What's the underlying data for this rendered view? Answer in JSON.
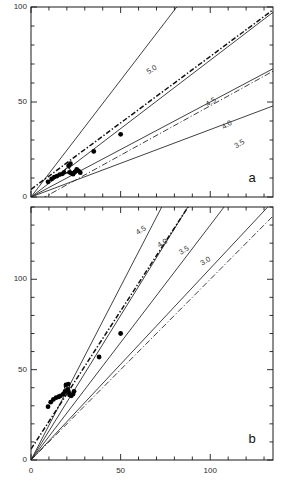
{
  "figure": {
    "panel_a_tag": "a",
    "panel_b_tag": "b"
  },
  "chart_data": [
    {
      "panel": "a",
      "type": "scatter",
      "title": "",
      "xlabel": "",
      "ylabel": "",
      "xlim": [
        0,
        135
      ],
      "ylim": [
        0,
        100
      ],
      "xticks_major": [
        0,
        50,
        100
      ],
      "xticks_minor_step": 10,
      "yticks_major": [
        0,
        50,
        100
      ],
      "yticks_minor_step": 10,
      "xticklabels": [
        "",
        "",
        ""
      ],
      "yticklabels": [
        "0",
        "50",
        "100"
      ],
      "grid": false,
      "legend": "none",
      "annotations": [
        {
          "text": "5.0",
          "x": 68,
          "y": 66
        },
        {
          "text": "4.5",
          "x": 101,
          "y": 49
        },
        {
          "text": "4.0",
          "x": 110,
          "y": 37
        },
        {
          "text": "3.5",
          "x": 117,
          "y": 27
        }
      ],
      "model_lines": [
        {
          "label": "5.0",
          "slope": 1.23,
          "intercept": 0.0
        },
        {
          "label": "4.5",
          "slope": 0.72,
          "intercept": 0.0
        },
        {
          "label": "4.0",
          "slope": 0.5,
          "intercept": 0.0
        },
        {
          "label": "3.5",
          "slope": 0.355,
          "intercept": 0.0
        }
      ],
      "fit_line": {
        "label": "best fit",
        "style": "dash-dot",
        "slope": 0.7,
        "intercept": 4.0
      },
      "unity_line": {
        "label": "1:1",
        "style": "dash-dot",
        "slope": 0.52,
        "intercept": -4.0
      },
      "points": [
        {
          "x": 9.5,
          "y": 8.0,
          "marker": "filled"
        },
        {
          "x": 11.5,
          "y": 9.5,
          "marker": "filled"
        },
        {
          "x": 13.0,
          "y": 10.5,
          "marker": "filled"
        },
        {
          "x": 14.5,
          "y": 11.0,
          "marker": "filled"
        },
        {
          "x": 16.0,
          "y": 11.8,
          "marker": "filled"
        },
        {
          "x": 17.5,
          "y": 12.2,
          "marker": "filled"
        },
        {
          "x": 18.5,
          "y": 13.0,
          "marker": "filled"
        },
        {
          "x": 19.5,
          "y": 13.5,
          "marker": "filled"
        },
        {
          "x": 20.5,
          "y": 14.0,
          "marker": "open"
        },
        {
          "x": 21.5,
          "y": 13.0,
          "marker": "filled"
        },
        {
          "x": 22.5,
          "y": 12.5,
          "marker": "filled"
        },
        {
          "x": 23.5,
          "y": 12.0,
          "marker": "filled"
        },
        {
          "x": 24.5,
          "y": 13.2,
          "marker": "filled"
        },
        {
          "x": 25.5,
          "y": 14.5,
          "marker": "filled"
        },
        {
          "x": 26.5,
          "y": 13.8,
          "marker": "filled"
        },
        {
          "x": 27.5,
          "y": 12.8,
          "marker": "filled"
        },
        {
          "x": 21.0,
          "y": 16.5,
          "marker": "filled"
        },
        {
          "x": 22.0,
          "y": 17.5,
          "marker": "filled"
        },
        {
          "x": 35.0,
          "y": 24.0,
          "marker": "filled"
        },
        {
          "x": 50.0,
          "y": 33.0,
          "marker": "filled"
        }
      ]
    },
    {
      "panel": "b",
      "type": "scatter",
      "title": "",
      "xlabel": "",
      "ylabel": "",
      "xlim": [
        0,
        135
      ],
      "ylim": [
        0,
        140
      ],
      "xticks_major": [
        0,
        50,
        100
      ],
      "xticks_minor_step": 10,
      "yticks_major": [
        0,
        50,
        100
      ],
      "yticks_minor_step": 10,
      "xticklabels": [
        "0",
        "50",
        "100"
      ],
      "yticklabels": [
        "0",
        "50",
        "100"
      ],
      "grid": false,
      "legend": "none",
      "annotations": [
        {
          "text": "4.5",
          "x": 62,
          "y": 126
        },
        {
          "text": "4.0",
          "x": 74,
          "y": 119
        },
        {
          "text": "3.5",
          "x": 86,
          "y": 115
        },
        {
          "text": "3.0",
          "x": 98,
          "y": 109
        }
      ],
      "model_lines": [
        {
          "label": "4.5",
          "slope": 1.92,
          "intercept": 0.0
        },
        {
          "label": "4.0",
          "slope": 1.6,
          "intercept": 0.0
        },
        {
          "label": "3.5",
          "slope": 1.3,
          "intercept": 0.0
        },
        {
          "label": "3.0",
          "slope": 1.06,
          "intercept": 0.0
        }
      ],
      "fit_line": {
        "label": "best fit",
        "style": "dash-dot",
        "slope": 1.53,
        "intercept": 6.0
      },
      "unity_line": {
        "label": "1:1",
        "style": "dash-dot",
        "slope": 1.0,
        "intercept": 0.0
      },
      "points": [
        {
          "x": 9.5,
          "y": 29.5,
          "marker": "filled"
        },
        {
          "x": 11.0,
          "y": 32.0,
          "marker": "filled"
        },
        {
          "x": 12.5,
          "y": 33.5,
          "marker": "filled"
        },
        {
          "x": 14.0,
          "y": 34.5,
          "marker": "filled"
        },
        {
          "x": 15.5,
          "y": 35.0,
          "marker": "filled"
        },
        {
          "x": 16.5,
          "y": 35.5,
          "marker": "filled"
        },
        {
          "x": 18.0,
          "y": 36.5,
          "marker": "filled"
        },
        {
          "x": 19.0,
          "y": 38.0,
          "marker": "filled"
        },
        {
          "x": 20.0,
          "y": 40.5,
          "marker": "open"
        },
        {
          "x": 20.5,
          "y": 39.0,
          "marker": "filled"
        },
        {
          "x": 21.0,
          "y": 37.5,
          "marker": "filled"
        },
        {
          "x": 21.5,
          "y": 36.0,
          "marker": "filled"
        },
        {
          "x": 22.5,
          "y": 35.5,
          "marker": "filled"
        },
        {
          "x": 23.5,
          "y": 36.5,
          "marker": "filled"
        },
        {
          "x": 24.0,
          "y": 38.0,
          "marker": "filled"
        },
        {
          "x": 19.5,
          "y": 41.5,
          "marker": "filled"
        },
        {
          "x": 20.8,
          "y": 42.0,
          "marker": "filled"
        },
        {
          "x": 38.0,
          "y": 57.0,
          "marker": "filled"
        },
        {
          "x": 50.0,
          "y": 70.0,
          "marker": "filled"
        }
      ]
    }
  ]
}
